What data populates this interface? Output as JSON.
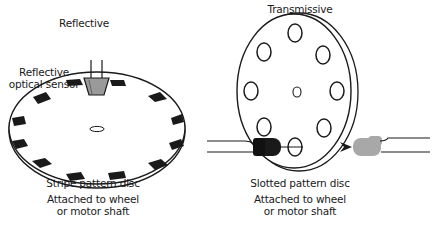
{
  "left_panel": {
    "heading": "Reflective",
    "sensor_label_line1": "Reflective",
    "sensor_label_line2": "optical sensor",
    "disc_caption": "Stripe pattern disc",
    "attach_line1": "Attached to wheel",
    "attach_line2": "or motor shaft",
    "stripe_count": 16
  },
  "right_panel": {
    "heading": "Transmissive",
    "disc_caption": "Slotted pattern disc",
    "attach_line1": "Attached to wheel",
    "attach_line2": "or motor shaft",
    "slot_count": 8
  },
  "colors": {
    "stroke": "#1a1a1a",
    "sensor_fill": "#9a9a9a",
    "emitter_fill": "#1a1a1a",
    "receiver_fill": "#a8a8a8",
    "background": "#ffffff"
  }
}
